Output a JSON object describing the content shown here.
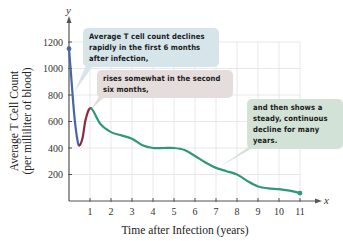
{
  "chart_data": {
    "type": "line",
    "title": "",
    "xlabel": "Time after Infection (years)",
    "ylabel": "Average T Cell Count (per milliliter of blood)",
    "ylabel_line1": "Average T Cell Count",
    "ylabel_line2": "(per milliliter of blood)",
    "x_axis_letter": "x",
    "y_axis_letter": "y",
    "xlim": [
      0,
      11
    ],
    "ylim": [
      0,
      1300
    ],
    "grid": true,
    "x_ticks": [
      1,
      2,
      3,
      4,
      5,
      6,
      7,
      8,
      9,
      10,
      11
    ],
    "y_ticks": [
      200,
      400,
      600,
      800,
      1000,
      1200
    ],
    "series": [
      {
        "name": "T cell count",
        "x": [
          0,
          0.1,
          0.25,
          0.4,
          0.5,
          0.65,
          0.8,
          1.05,
          1.5,
          2,
          2.5,
          3,
          3.5,
          4,
          4.5,
          5,
          5.5,
          6,
          6.5,
          7,
          7.5,
          8,
          8.5,
          9,
          9.5,
          10,
          10.5,
          11
        ],
        "y": [
          1150,
          950,
          650,
          460,
          420,
          480,
          620,
          700,
          580,
          520,
          495,
          470,
          420,
          400,
          400,
          400,
          385,
          340,
          290,
          250,
          225,
          200,
          150,
          110,
          95,
          90,
          78,
          60
        ]
      }
    ],
    "segments": [
      {
        "name": "rapid decline",
        "x_range": [
          0,
          0.5
        ],
        "color": "#4a66a8"
      },
      {
        "name": "rise",
        "x_range": [
          0.5,
          1.0
        ],
        "color": "#8a2c3c"
      },
      {
        "name": "steady decline",
        "x_range": [
          1.0,
          11
        ],
        "color": "#2f9a72"
      }
    ],
    "annotations": [
      {
        "text": "Average T cell count declines rapidly in the first 6 months after infection,",
        "points_to": [
          0.15,
          820
        ]
      },
      {
        "text": "rises somewhat in the second six months,",
        "points_to": [
          1.0,
          690
        ]
      },
      {
        "text": "and then shows a steady, continuous decline for many years.",
        "points_to": [
          7.1,
          250
        ]
      }
    ]
  },
  "callouts": {
    "c1": "Average T cell count declines rapidly in the first 6 months after infection,",
    "c2": "rises somewhat in the second six months,",
    "c3": "and then shows a steady, continuous decline for many years."
  }
}
